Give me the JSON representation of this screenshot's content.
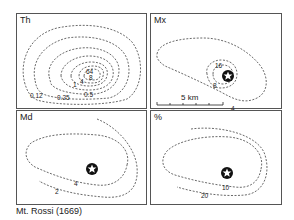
{
  "panels": [
    {
      "id": "th",
      "title": "Th",
      "contour_labels": [
        "64",
        "8",
        "4",
        "1",
        "0.5",
        "0.25",
        "0.12",
        "8"
      ]
    },
    {
      "id": "mx",
      "title": "Mx",
      "contour_labels": [
        "16",
        "8",
        "4"
      ],
      "scale_bar": "5 km"
    },
    {
      "id": "md",
      "title": "Md",
      "contour_labels": [
        "4",
        "2"
      ]
    },
    {
      "id": "pct",
      "title": "%",
      "contour_labels": [
        "10",
        "20"
      ]
    }
  ],
  "caption": "Mt. Rossi (1669)",
  "colors": {
    "line": "#444444",
    "text": "#222222"
  }
}
